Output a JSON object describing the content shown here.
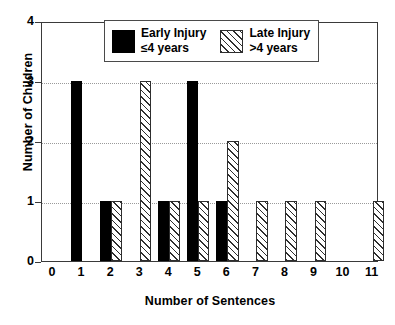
{
  "chart_data": {
    "type": "bar",
    "title": "",
    "xlabel": "Number of Sentences",
    "ylabel": "Number of Children",
    "categories": [
      "0",
      "1",
      "2",
      "3",
      "4",
      "5",
      "6",
      "7",
      "8",
      "9",
      "10",
      "11"
    ],
    "xlim": [
      0,
      11
    ],
    "ylim": [
      0,
      4
    ],
    "yticks": [
      "0",
      "1",
      "2",
      "3",
      "4"
    ],
    "grid": "horizontal-dotted",
    "legend_position": "top-center",
    "series": [
      {
        "name": "Early Injury",
        "detail": "≤4 years",
        "style": "solid-black",
        "color": "#000000",
        "values": [
          0,
          3,
          1,
          0,
          1,
          3,
          1,
          0,
          0,
          0,
          0,
          0
        ]
      },
      {
        "name": "Late Injury",
        "detail": ">4 years",
        "style": "diagonal-hatch",
        "color": "#2e2e2e",
        "values": [
          0,
          0,
          1,
          3,
          1,
          1,
          2,
          1,
          1,
          1,
          0,
          1
        ]
      }
    ]
  },
  "legend": {
    "entries": [
      {
        "label": "Early Injury",
        "sub": "≤4 years"
      },
      {
        "label": "Late Injury",
        "sub": ">4 years"
      }
    ]
  }
}
